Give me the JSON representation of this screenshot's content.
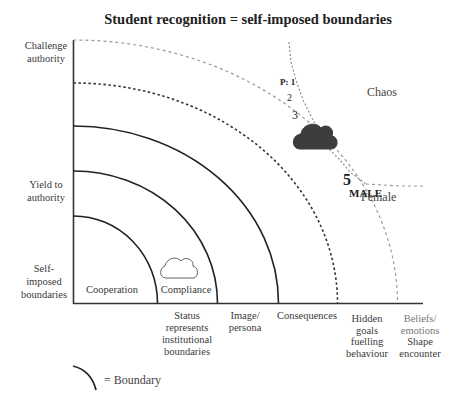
{
  "title": "Student recognition = self-imposed boundaries",
  "y_axis_labels": {
    "top": [
      "Challenge",
      "authority"
    ],
    "middle": [
      "Yield to",
      "authority"
    ],
    "bottom": [
      "Self-",
      "imposed",
      "boundaries"
    ]
  },
  "zones": {
    "cooperation": "Cooperation",
    "compliance": "Compliance",
    "chaos": "Chaos"
  },
  "x_axis_labels": [
    [
      "Status",
      "represents",
      "institutional",
      "boundaries"
    ],
    [
      "Image/",
      "persona"
    ],
    [
      "Consequences"
    ],
    [
      "Hidden",
      "goals",
      "fuelling",
      "behaviour"
    ],
    [
      "Beliefs/",
      "emotions",
      "Shape",
      "encounter"
    ]
  ],
  "path_points": {
    "p1": "P: 1",
    "p2": "2",
    "p3": "3",
    "p4": "4",
    "p5": "5"
  },
  "gender": {
    "male": "MALE",
    "female": "Female"
  },
  "legend": {
    "label": "= Boundary"
  },
  "colors": {
    "ink": "#222222",
    "cloud_dark": "#3d3d3d",
    "dashed_light": "#999999"
  }
}
